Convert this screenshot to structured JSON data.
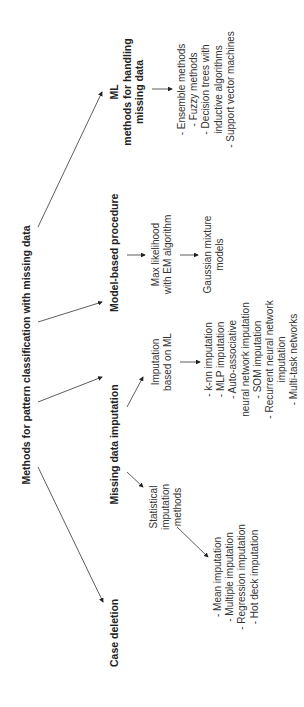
{
  "diagram": {
    "title": "Methods for pattern classification with missing data",
    "categories": [
      {
        "id": "case-deletion",
        "label": "Case deletion"
      },
      {
        "id": "missing-data-imputation",
        "label": "Missing data imputation"
      },
      {
        "id": "model-based-procedure",
        "label": "Model-based procedure"
      },
      {
        "id": "ml-methods",
        "label_lines": [
          "ML",
          "methods for handling",
          "missing data"
        ]
      }
    ],
    "imputation": {
      "statistical": {
        "label_lines": [
          "Statistical",
          "imputation",
          "methods"
        ],
        "items": [
          "- Mean imputation",
          "- Multiple imputation",
          "- Regression imputation",
          "- Hot deck imputation"
        ]
      },
      "ml_based": {
        "label_lines": [
          "Imputation",
          "based on ML"
        ],
        "items": [
          "- k-nn imputation",
          "- MLP imputation",
          "- Auto-associative",
          "neural network imputation",
          "- SOM imputation",
          "- Recurrent neural network",
          "imputation",
          "- Multi-task networks"
        ]
      }
    },
    "model_based": {
      "step1_lines": [
        "Max likelihood",
        "with EM algorithm"
      ],
      "step2_lines": [
        "Gaussian mixture",
        "models"
      ]
    },
    "ml_methods_items": [
      "- Ensemble methods",
      "- Fuzzy methods",
      "- Decision trees with",
      "inductive algorithms",
      "- Support vector machines"
    ]
  }
}
